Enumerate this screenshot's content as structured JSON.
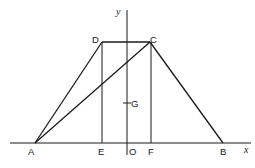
{
  "diagram": {
    "type": "geometry",
    "axes": {
      "x_label": "x",
      "y_label": "y",
      "origin_label": "O"
    },
    "points": {
      "A": {
        "label": "A"
      },
      "B": {
        "label": "B"
      },
      "C": {
        "label": "C"
      },
      "D": {
        "label": "D"
      },
      "E": {
        "label": "E"
      },
      "F": {
        "label": "F"
      },
      "O": {
        "label": "O"
      },
      "G": {
        "label": "G"
      }
    },
    "segments": [
      "AB",
      "BC",
      "CD",
      "DA",
      "AC",
      "DE",
      "CF"
    ],
    "color": "#1a1a1a"
  }
}
